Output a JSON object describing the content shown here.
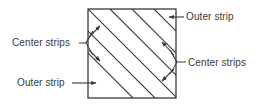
{
  "figure": {
    "type": "technical-diagram",
    "colors": {
      "stroke": "#3a3a3a",
      "text": "#3a3a3a",
      "background": "#ffffff"
    },
    "square": {
      "x": 88,
      "y": 9,
      "width": 88,
      "height": 89,
      "hatch_angle_degrees": 45,
      "hatch_line_count": 5
    }
  },
  "labels": {
    "outer_strip_top": "Outer strip",
    "center_strips_right": "Center strips",
    "center_strips_left": "Center strips",
    "outer_strip_bottom": "Outer strip"
  },
  "annotations": [
    {
      "id": "outer-strip-top",
      "text": "Outer strip",
      "leader": "horizontal-line-with-arrow",
      "arrow_direction": "left",
      "points_to": "top-right outer strip"
    },
    {
      "id": "center-strips-right",
      "text": "Center strips",
      "leader": "angle-bracket-with-two-arrows",
      "arrow_direction": "up-left-and-down-left",
      "points_to": "two center strips on right"
    },
    {
      "id": "center-strips-left",
      "text": "Center strips",
      "leader": "angle-bracket-with-two-arrows",
      "arrow_direction": "up-right-and-down-right",
      "points_to": "two center strips on left"
    },
    {
      "id": "outer-strip-bottom",
      "text": "Outer strip",
      "leader": "horizontal-line-with-arrow",
      "arrow_direction": "right",
      "points_to": "bottom-left outer strip"
    }
  ]
}
